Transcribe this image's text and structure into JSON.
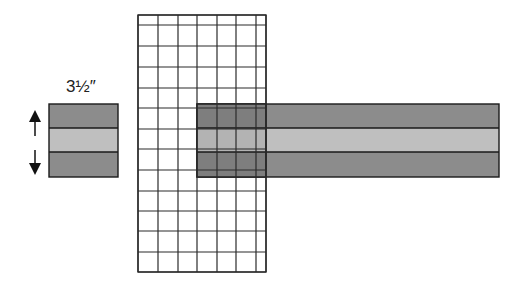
{
  "diagram": {
    "label": "3½″",
    "colors": {
      "dark_fabric": "#8c8c8c",
      "light_fabric": "#bfbfbf",
      "overlap_dark": "#7e7e7e",
      "overlap_light": "#b3b3b3",
      "line": "#1a1a1a",
      "grid_line": "#2a2a2a"
    },
    "swatch": {
      "x": 49,
      "y": 104,
      "w": 69,
      "h": 73,
      "seams": [
        128,
        152
      ]
    },
    "arrows": {
      "x": 35,
      "up": [
        112,
        136
      ],
      "down": [
        150,
        173
      ]
    },
    "ruler": {
      "x0": 138,
      "x1": 266,
      "y0": 15,
      "y1": 272,
      "cols": [
        138,
        158,
        178,
        197,
        217,
        236,
        256,
        266
      ],
      "rows": [
        15,
        25,
        46,
        67,
        88,
        108,
        129,
        149,
        170,
        191,
        211,
        231,
        252,
        272
      ]
    },
    "strip": {
      "x": 197,
      "y": 104,
      "w": 302,
      "h": 73,
      "seams": [
        128,
        152
      ]
    }
  }
}
